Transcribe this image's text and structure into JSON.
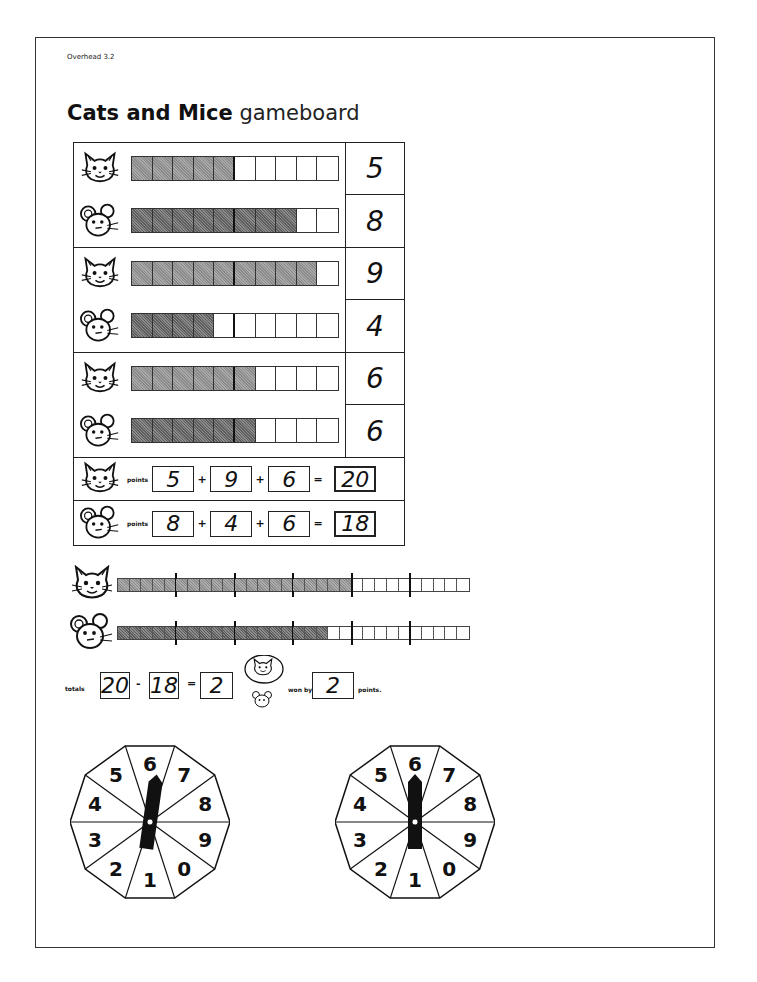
{
  "header": {
    "overhead_label": "Overhead 3.2",
    "title_bold": "Cats and Mice",
    "title_light": "gameboard"
  },
  "board": {
    "rounds": [
      {
        "cat": {
          "icon": "cat-face-icon",
          "filled": 5,
          "score": "5"
        },
        "mouse": {
          "icon": "mouse-face-icon",
          "filled": 8,
          "score": "8"
        }
      },
      {
        "cat": {
          "icon": "cat-face-icon",
          "filled": 9,
          "score": "9"
        },
        "mouse": {
          "icon": "mouse-face-icon",
          "filled": 4,
          "score": "4"
        }
      },
      {
        "cat": {
          "icon": "cat-face-icon",
          "filled": 6,
          "score": "6"
        },
        "mouse": {
          "icon": "mouse-face-icon",
          "filled": 6,
          "score": "6"
        }
      }
    ],
    "cells_per_bar": 10,
    "points": {
      "label": "points",
      "cat": {
        "values": [
          "5",
          "9",
          "6"
        ],
        "total": "20"
      },
      "mouse": {
        "values": [
          "8",
          "4",
          "6"
        ],
        "total": "18"
      },
      "plus": "+",
      "equals": "="
    }
  },
  "long_bars": {
    "cells": 30,
    "tick_every": 5,
    "cat_filled": 20,
    "mouse_filled": 18
  },
  "totals": {
    "label": "totals",
    "cat_total": "20",
    "minus": "-",
    "mouse_total": "18",
    "equals": "=",
    "difference": "2",
    "winner": "cat",
    "won_by_label": "won by",
    "won_by_value": "2",
    "points_label": "points."
  },
  "spinners": [
    {
      "labels": [
        "6",
        "7",
        "8",
        "9",
        "0",
        "1",
        "2",
        "3",
        "4",
        "5"
      ],
      "pointer_angle": 8
    },
    {
      "labels": [
        "6",
        "7",
        "8",
        "9",
        "0",
        "1",
        "2",
        "3",
        "4",
        "5"
      ],
      "pointer_angle": 0
    }
  ],
  "colors": {
    "ink": "#111111",
    "cat_fill": "#9a9a9a",
    "mouse_fill": "#707070",
    "paper": "#ffffff"
  }
}
